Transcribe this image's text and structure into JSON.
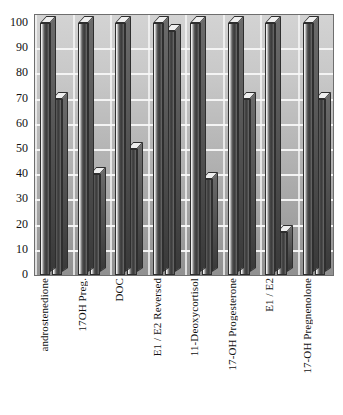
{
  "chart_data": {
    "type": "bar",
    "title": "",
    "subtitle": "",
    "xlabel": "",
    "ylabel": "",
    "ylim": [
      0,
      100
    ],
    "yticks": [
      100,
      90,
      80,
      70,
      60,
      50,
      40,
      30,
      20,
      10,
      0
    ],
    "grid": true,
    "legend": "none",
    "style": "3d-grayscale-bars",
    "categories": [
      "androstenedione",
      "17OH Preg.",
      "DOC",
      "E1 / E2 Reversed",
      "11-Deoxycortisol",
      "17-OH Progesterone",
      "E1 / E2",
      "17-OH Pregnenolone"
    ],
    "series": [
      {
        "name": "Series 1",
        "values": [
          100,
          100,
          100,
          100,
          100,
          100,
          100,
          100
        ]
      },
      {
        "name": "Series 2",
        "values": [
          70,
          40,
          50,
          97,
          38,
          70,
          17,
          70
        ]
      }
    ]
  },
  "colors": {
    "plot_background_top": "#d3d3d3",
    "plot_background_bottom": "#909090",
    "gridline": "#f4f4f4",
    "bar_dark": "#3b3b3b",
    "bar_highlight": "#fbfbfb",
    "axis_text": "#111111",
    "frame_border": "#6e6e6e",
    "page_background": "#ffffff"
  }
}
